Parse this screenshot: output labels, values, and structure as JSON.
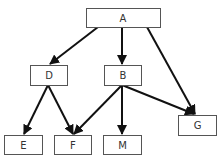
{
  "diagram": {
    "type": "directed-graph",
    "nodes": [
      {
        "id": "A",
        "label": "A",
        "x": 86,
        "y": 8,
        "w": 74,
        "h": 19
      },
      {
        "id": "D",
        "label": "D",
        "x": 30,
        "y": 65,
        "w": 37,
        "h": 20
      },
      {
        "id": "B",
        "label": "B",
        "x": 104,
        "y": 65,
        "w": 37,
        "h": 20
      },
      {
        "id": "G",
        "label": "G",
        "x": 178,
        "y": 115,
        "w": 38,
        "h": 20
      },
      {
        "id": "E",
        "label": "E",
        "x": 4,
        "y": 135,
        "w": 38,
        "h": 19
      },
      {
        "id": "F",
        "label": "F",
        "x": 54,
        "y": 135,
        "w": 37,
        "h": 19
      },
      {
        "id": "M",
        "label": "M",
        "x": 103,
        "y": 135,
        "w": 38,
        "h": 19
      }
    ],
    "edges": [
      {
        "from": "A",
        "to": "D"
      },
      {
        "from": "A",
        "to": "B"
      },
      {
        "from": "A",
        "to": "G"
      },
      {
        "from": "D",
        "to": "E"
      },
      {
        "from": "D",
        "to": "F"
      },
      {
        "from": "B",
        "to": "F"
      },
      {
        "from": "B",
        "to": "M"
      },
      {
        "from": "B",
        "to": "G"
      }
    ],
    "colors": {
      "edge": "#111111",
      "box_border": "#555555",
      "text": "#333333"
    }
  }
}
